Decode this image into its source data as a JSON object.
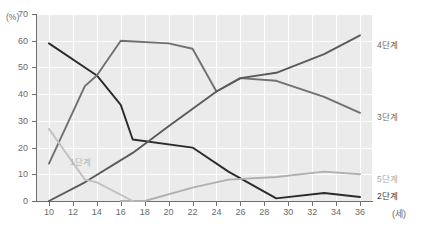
{
  "chart_data": {
    "type": "line",
    "title": "",
    "xlabel": "(세)",
    "ylabel": "(%)",
    "xlim": [
      9,
      37
    ],
    "ylim": [
      0,
      70
    ],
    "grid": true,
    "legend_position": "right",
    "x": [
      10,
      11,
      13,
      14,
      16,
      17,
      18,
      20,
      22,
      24,
      25,
      26,
      29,
      31,
      33,
      35,
      36
    ],
    "xticks": [
      "10",
      "12",
      "14",
      "16",
      "18",
      "20",
      "22",
      "24",
      "26",
      "28",
      "30",
      "32",
      "34",
      "36"
    ],
    "xtick_values": [
      10,
      12,
      14,
      16,
      18,
      20,
      22,
      24,
      26,
      28,
      30,
      32,
      34,
      36
    ],
    "yticks": [
      "0",
      "10",
      "20",
      "30",
      "40",
      "50",
      "60",
      "70"
    ],
    "ytick_values": [
      0,
      10,
      20,
      30,
      40,
      50,
      60,
      70
    ],
    "series": [
      {
        "name": "2단계",
        "color": "#2b2b2b",
        "label_position": "right",
        "points": [
          [
            10,
            59
          ],
          [
            14,
            47
          ],
          [
            16,
            36
          ],
          [
            17,
            23
          ],
          [
            22,
            20
          ],
          [
            25,
            11
          ],
          [
            29,
            1
          ],
          [
            33,
            3
          ],
          [
            36,
            1.5
          ]
        ]
      },
      {
        "name": "3단계",
        "color": "#707070",
        "label_position": "right",
        "points": [
          [
            10,
            14
          ],
          [
            13,
            43
          ],
          [
            14,
            47
          ],
          [
            16,
            60
          ],
          [
            20,
            59
          ],
          [
            22,
            57
          ],
          [
            24,
            41
          ],
          [
            26,
            46
          ],
          [
            29,
            45
          ],
          [
            33,
            39
          ],
          [
            36,
            33
          ]
        ]
      },
      {
        "name": "4단계",
        "color": "#5a5a5a",
        "label_position": "right",
        "points": [
          [
            10,
            0
          ],
          [
            13,
            7
          ],
          [
            17,
            18
          ],
          [
            20,
            28
          ],
          [
            24,
            41
          ],
          [
            26,
            46
          ],
          [
            29,
            48
          ],
          [
            33,
            55
          ],
          [
            36,
            62
          ]
        ]
      },
      {
        "name": "5단계",
        "color": "#b0b0b0",
        "label_position": "right",
        "points": [
          [
            16,
            0
          ],
          [
            18,
            0
          ],
          [
            22,
            5
          ],
          [
            25,
            8
          ],
          [
            29,
            9
          ],
          [
            33,
            11
          ],
          [
            36,
            10
          ]
        ]
      },
      {
        "name": "1단계",
        "color": "#c2c2c2",
        "label_position": "inline",
        "points": [
          [
            10,
            27
          ],
          [
            13,
            8
          ],
          [
            14,
            7
          ],
          [
            17,
            0
          ]
        ]
      }
    ]
  },
  "legend": {
    "s4": "4단계",
    "s3": "3단계",
    "s5": "5단계",
    "s2": "2단계",
    "s1": "1단계"
  },
  "axis": {
    "y_unit": "(%)",
    "x_unit": "(세)"
  }
}
